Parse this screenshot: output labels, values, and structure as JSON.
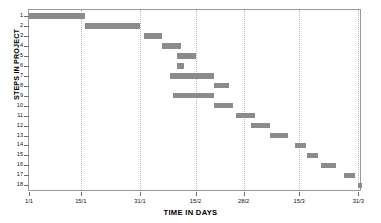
{
  "chart_data": {
    "type": "bar",
    "subtype": "gantt",
    "title": "",
    "xlabel": "TIME IN DAYS",
    "ylabel": "STEPS IN PROJECT",
    "grid": "vertical-dotted",
    "legend": "none",
    "bar_color": "#8b8b8b",
    "xlim_days": [
      0,
      90
    ],
    "xtick_labels": [
      "1/1",
      "15/1",
      "31/1",
      "15/2",
      "28/2",
      "15/3",
      "31/3"
    ],
    "xtick_days": [
      0,
      14,
      30,
      45,
      58,
      73,
      89
    ],
    "categories": [
      "1",
      "2",
      "3",
      "4",
      "5",
      "6",
      "7",
      "8",
      "9",
      "10",
      "11",
      "12",
      "13",
      "14",
      "15",
      "16",
      "17",
      "18"
    ],
    "ylabel_ticks": [
      "1",
      "2",
      "3",
      "4",
      "5",
      "6",
      "7",
      "8",
      "9",
      "10",
      "11",
      "12",
      "13",
      "14",
      "15",
      "16",
      "17",
      "18"
    ],
    "tasks": [
      {
        "step": "1",
        "start_day": 0,
        "end_day": 15,
        "start_label": "1/1",
        "end_label": "15/1"
      },
      {
        "step": "2",
        "start_day": 15,
        "end_day": 30,
        "start_label": "15/1",
        "end_label": "31/1"
      },
      {
        "step": "3",
        "start_day": 31,
        "end_day": 36,
        "start_label": "31/1",
        "end_label": "5/2"
      },
      {
        "step": "4",
        "start_day": 36,
        "end_day": 41,
        "start_label": "5/2",
        "end_label": "10/2"
      },
      {
        "step": "5",
        "start_day": 40,
        "end_day": 45,
        "start_label": "9/2",
        "end_label": "15/2"
      },
      {
        "step": "6",
        "start_day": 40,
        "end_day": 42,
        "start_label": "9/2",
        "end_label": "11/2"
      },
      {
        "step": "7",
        "start_day": 38,
        "end_day": 50,
        "start_label": "7/2",
        "end_label": "20/2"
      },
      {
        "step": "8",
        "start_day": 50,
        "end_day": 54,
        "start_label": "20/2",
        "end_label": "24/2"
      },
      {
        "step": "9",
        "start_day": 39,
        "end_day": 50,
        "start_label": "8/2",
        "end_label": "20/2"
      },
      {
        "step": "10",
        "start_day": 50,
        "end_day": 55,
        "start_label": "20/2",
        "end_label": "25/2"
      },
      {
        "step": "11",
        "start_day": 56,
        "end_day": 61,
        "start_label": "26/2",
        "end_label": "2/3"
      },
      {
        "step": "12",
        "start_day": 60,
        "end_day": 65,
        "start_label": "1/3",
        "end_label": "6/3"
      },
      {
        "step": "13",
        "start_day": 65,
        "end_day": 70,
        "start_label": "6/3",
        "end_label": "11/3"
      },
      {
        "step": "14",
        "start_day": 72,
        "end_day": 75,
        "start_label": "13/3",
        "end_label": "16/3"
      },
      {
        "step": "15",
        "start_day": 75,
        "end_day": 78,
        "start_label": "16/3",
        "end_label": "19/3"
      },
      {
        "step": "16",
        "start_day": 79,
        "end_day": 83,
        "start_label": "20/3",
        "end_label": "24/3"
      },
      {
        "step": "17",
        "start_day": 85,
        "end_day": 88,
        "start_label": "26/3",
        "end_label": "29/3"
      },
      {
        "step": "18",
        "start_day": 89,
        "end_day": 90,
        "start_label": "30/3",
        "end_label": "31/3"
      }
    ]
  }
}
